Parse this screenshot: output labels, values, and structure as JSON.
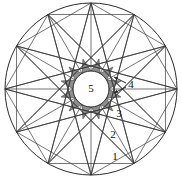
{
  "figure": {
    "canvas": {
      "width": 182,
      "height": 188
    },
    "colors": {
      "background": "#ffffff",
      "stroke": "#3a3a3a",
      "stroke_outer": "#2b2b2b",
      "shaded_fill": "#8d8d8d",
      "inner_fill": "#ffffff",
      "label_text": "#111111"
    },
    "outer_circle": {
      "cx": 91,
      "cy": 89,
      "r": 86,
      "fill": "none"
    },
    "inner_circle": {
      "cx": 91,
      "cy": 89,
      "r": 18,
      "fill": "#ffffff"
    },
    "vertex_count": 12,
    "vertex_start_angle_deg": -90,
    "star_skip": 5,
    "spokes": true
  },
  "labels": [
    {
      "id": "label-1",
      "text": "1",
      "x": 115,
      "y": 157
    },
    {
      "id": "label-2",
      "text": "2",
      "x": 113,
      "y": 135
    },
    {
      "id": "label-3",
      "text": "3",
      "x": 119,
      "y": 114
    },
    {
      "id": "label-4",
      "text": "4",
      "x": 131,
      "y": 85
    },
    {
      "id": "label-5",
      "text": "5",
      "x": 91,
      "y": 89
    }
  ],
  "leader_lines": [
    {
      "id": "leader-4-upper",
      "x1": 126,
      "y1": 83,
      "x2": 114,
      "y2": 77
    },
    {
      "id": "leader-4-lower",
      "x1": 126,
      "y1": 87,
      "x2": 114,
      "y2": 93
    }
  ],
  "legend": {
    "description": "Numbers 1 through 5 mark nested regions of the construction: 1 outermost circular-segment region, 2 and 3 intermediate triangular regions, 4 the shaded star points, 5 the central disc."
  }
}
